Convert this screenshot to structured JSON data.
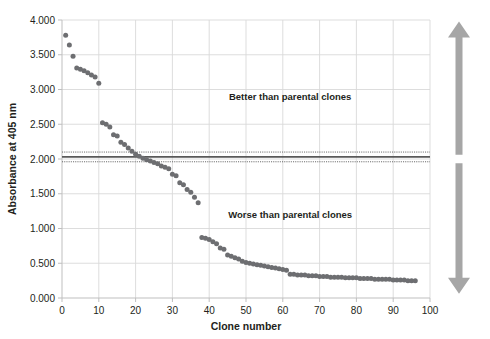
{
  "chart_data": {
    "type": "scatter",
    "title": "",
    "xlabel": "Clone number",
    "ylabel": "Absorbance at 405 nm",
    "xlim": [
      0,
      100
    ],
    "ylim": [
      0.0,
      4.0
    ],
    "xticks": [
      0,
      10,
      20,
      30,
      40,
      50,
      60,
      70,
      80,
      90,
      100
    ],
    "yticks": [
      0.0,
      0.5,
      1.0,
      1.5,
      2.0,
      2.5,
      3.0,
      3.5,
      4.0
    ],
    "ytick_labels": [
      "0.000",
      "0.500",
      "1.000",
      "1.500",
      "2.000",
      "2.500",
      "3.000",
      "3.500",
      "4.000"
    ],
    "xtick_labels": [
      "0",
      "10",
      "20",
      "30",
      "40",
      "50",
      "60",
      "70",
      "80",
      "90",
      "100"
    ],
    "grid": true,
    "legend": false,
    "marker_color": "#6d6e71",
    "series": [
      {
        "name": "Clone absorbance",
        "x": [
          1,
          2,
          3,
          4,
          5,
          6,
          7,
          8,
          9,
          10,
          11,
          12,
          13,
          14,
          15,
          16,
          17,
          18,
          19,
          20,
          21,
          22,
          23,
          24,
          25,
          26,
          27,
          28,
          29,
          30,
          31,
          32,
          33,
          34,
          35,
          36,
          37,
          38,
          39,
          40,
          41,
          42,
          43,
          44,
          45,
          46,
          47,
          48,
          49,
          50,
          51,
          52,
          53,
          54,
          55,
          56,
          57,
          58,
          59,
          60,
          61,
          62,
          63,
          64,
          65,
          66,
          67,
          68,
          69,
          70,
          71,
          72,
          73,
          74,
          75,
          76,
          77,
          78,
          79,
          80,
          81,
          82,
          83,
          84,
          85,
          86,
          87,
          88,
          89,
          90,
          91,
          92,
          93,
          94,
          95,
          96
        ],
        "y": [
          3.78,
          3.64,
          3.48,
          3.31,
          3.29,
          3.27,
          3.24,
          3.21,
          3.18,
          3.09,
          2.52,
          2.5,
          2.46,
          2.35,
          2.33,
          2.24,
          2.21,
          2.16,
          2.11,
          2.07,
          2.04,
          2.01,
          1.99,
          1.97,
          1.95,
          1.93,
          1.9,
          1.88,
          1.86,
          1.78,
          1.76,
          1.66,
          1.63,
          1.56,
          1.52,
          1.45,
          1.37,
          0.87,
          0.86,
          0.84,
          0.81,
          0.78,
          0.72,
          0.7,
          0.62,
          0.6,
          0.58,
          0.56,
          0.53,
          0.51,
          0.5,
          0.49,
          0.48,
          0.47,
          0.46,
          0.45,
          0.44,
          0.43,
          0.42,
          0.41,
          0.4,
          0.34,
          0.34,
          0.33,
          0.33,
          0.33,
          0.32,
          0.32,
          0.32,
          0.31,
          0.31,
          0.31,
          0.3,
          0.3,
          0.3,
          0.3,
          0.29,
          0.29,
          0.29,
          0.29,
          0.28,
          0.28,
          0.28,
          0.28,
          0.27,
          0.27,
          0.27,
          0.27,
          0.27,
          0.26,
          0.26,
          0.26,
          0.26,
          0.25,
          0.25,
          0.25
        ]
      }
    ],
    "reference_lines": [
      {
        "name": "parental-mean",
        "value": 2.03,
        "style": "solid",
        "color": "#595959"
      },
      {
        "name": "parental-upper",
        "value": 2.1,
        "style": "dotted",
        "color": "#595959"
      },
      {
        "name": "parental-lower",
        "value": 1.96,
        "style": "dotted",
        "color": "#595959"
      }
    ],
    "annotations": [
      {
        "name": "better-label",
        "text": "Better than parental clones",
        "x": 62,
        "y": 2.85
      },
      {
        "name": "worse-label",
        "text": "Worse than parental clones",
        "x": 62,
        "y": 1.15
      }
    ],
    "arrows": [
      {
        "name": "up-arrow",
        "direction": "up",
        "color": "#a6a6a6",
        "from": 2.06,
        "to": 3.98
      },
      {
        "name": "down-arrow",
        "direction": "down",
        "color": "#a6a6a6",
        "from": 1.94,
        "to": 0.06
      }
    ]
  }
}
